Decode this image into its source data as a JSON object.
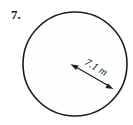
{
  "figure": {
    "problem_number": "7.",
    "shape": "circle",
    "dimension_label": "7.1 m",
    "dimension_value": 7.1,
    "dimension_unit": "m",
    "dimension_type": "radius",
    "colors": {
      "background": "#ffffff",
      "stroke": "#1d1d1d",
      "fill": "#fefefe",
      "text": "#1a1a1a"
    },
    "geometry": {
      "center_x": 75,
      "center_y": 64,
      "radius_px": 52,
      "arrow_start_x": 72,
      "arrow_start_y": 65,
      "arrow_end_x": 112,
      "arrow_end_y": 88,
      "arrow_angle_deg": 30,
      "label_x": 97,
      "label_y": 70,
      "number_x": 11,
      "number_y": 19
    }
  }
}
